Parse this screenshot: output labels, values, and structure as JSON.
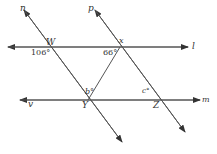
{
  "diagram": {
    "lines": {
      "l": "l",
      "m": "m",
      "n": "n",
      "p": "p",
      "v": "v"
    },
    "points": {
      "W": "W",
      "X": "x",
      "Y": "Y",
      "Z": "Z"
    },
    "angles": {
      "at_W": "106°",
      "at_X": "66°",
      "at_Y": "b°",
      "at_Z": "c°"
    },
    "colors": {
      "line": "#555555",
      "text": "#333333"
    }
  }
}
